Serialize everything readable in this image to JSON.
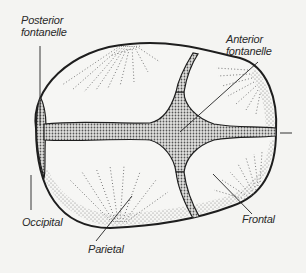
{
  "diagram": {
    "background": "#f4f4f2",
    "ink": "#1e1e1e",
    "labels": {
      "posterior_fontanelle": [
        "Posterior",
        "fontanelle"
      ],
      "anterior_fontanelle": [
        "Anterior",
        "fontanelle"
      ],
      "occipital": "Occipital",
      "parietal": "Parietal",
      "frontal": "Frontal"
    },
    "structures": [
      "posterior fontanelle",
      "anterior fontanelle",
      "occipital bone",
      "parietal bone",
      "frontal bone",
      "sagittal suture",
      "coronal suture",
      "lambdoid suture"
    ]
  }
}
